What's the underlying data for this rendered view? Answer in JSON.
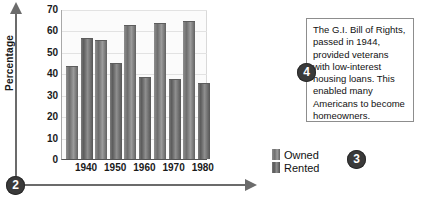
{
  "chart_data": {
    "type": "bar",
    "title": "",
    "xlabel": "",
    "ylabel": "Percentage",
    "ylim": [
      0,
      70
    ],
    "ytick_step": 10,
    "yticks": [
      "70",
      "60",
      "50",
      "40",
      "30",
      "20",
      "10",
      "0"
    ],
    "categories": [
      "1940",
      "1950",
      "1960",
      "1970",
      "1980"
    ],
    "grid": true,
    "legend_position": "right-bottom",
    "series": [
      {
        "name": "Owned",
        "values": [
          43,
          55,
          62,
          63,
          64
        ]
      },
      {
        "name": "Rented",
        "values": [
          56,
          44.5,
          38,
          37,
          35
        ]
      }
    ]
  },
  "axes": {
    "vertical_arrow_icon": "arrow-up-icon",
    "horizontal_arrow_icon": "arrow-right-icon"
  },
  "callouts": {
    "origin": "2",
    "legend": "3",
    "note": "4"
  },
  "note": {
    "text": "The G.I. Bill of Rights, passed in 1944, provided veterans with low-interest housing loans. This enabled many Americans to become homeowners."
  },
  "colors": {
    "bar_owned": "#6e6e6e",
    "bar_rented": "#5c5c5c",
    "badge": "#3a3a3a",
    "axis": "#6b6b6b",
    "grid": "#e2e2e2",
    "plot_background": "#fbfbfb"
  }
}
